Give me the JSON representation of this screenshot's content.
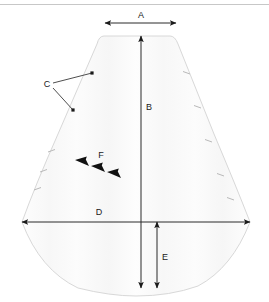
{
  "diagram": {
    "background_color": "#ffffff",
    "shape_fill_color": "#fbfbfb",
    "shape_stroke_color": "#d8d8d8",
    "dimension_line_color": "#2b2b2b",
    "label_color": "#1a1a1a",
    "header_rule_color": "#c7c7c7",
    "labels": {
      "a": "A",
      "b": "B",
      "c": "C",
      "d": "D",
      "e": "E",
      "f": "F"
    },
    "dimensions": [
      {
        "key": "a",
        "label": "A",
        "orientation": "horizontal",
        "arrow_heads": "both",
        "x1": 105,
        "x2": 176,
        "y": 23,
        "label_x": 141,
        "label_y": 16,
        "description": "top width"
      },
      {
        "key": "b",
        "label": "B",
        "orientation": "vertical",
        "arrow_heads": "both",
        "x": 141,
        "y1": 36,
        "y2": 288,
        "label_x": 149,
        "label_y": 108,
        "description": "overall height from top edge to bottom curve"
      },
      {
        "key": "d",
        "label": "D",
        "orientation": "horizontal",
        "arrow_heads": "both",
        "x1": 22,
        "x2": 250,
        "y": 222,
        "label_x": 99,
        "label_y": 213,
        "description": "widest horizontal span"
      },
      {
        "key": "e",
        "label": "E",
        "orientation": "vertical",
        "arrow_heads": "both",
        "x": 157,
        "y1": 222,
        "y2": 288,
        "label_x": 165,
        "label_y": 258,
        "description": "depth of bottom curve below widest span"
      }
    ],
    "callouts": [
      {
        "key": "c",
        "label": "C",
        "label_x": 47,
        "label_y": 85,
        "leaders": [
          {
            "x1": 53,
            "y1": 83,
            "x2": 92,
            "y2": 73
          },
          {
            "x1": 53,
            "y1": 88,
            "x2": 73,
            "y2": 110
          }
        ],
        "description": "corner radius callout with two leader lines"
      },
      {
        "key": "f",
        "label": "F",
        "label_x": 101,
        "label_y": 156,
        "chevrons": [
          {
            "x": 75,
            "y": 160
          },
          {
            "x": 91,
            "y": 166
          },
          {
            "x": 107,
            "y": 172
          }
        ],
        "description": "grain direction arrows pointing down-right"
      }
    ],
    "edge_ticks": {
      "left": [
        {
          "x": 48,
          "y": 152
        },
        {
          "x": 40,
          "y": 172
        },
        {
          "x": 34,
          "y": 190
        }
      ],
      "right": [
        {
          "x": 190,
          "y": 74
        },
        {
          "x": 201,
          "y": 108
        },
        {
          "x": 212,
          "y": 142
        },
        {
          "x": 224,
          "y": 176
        },
        {
          "x": 234,
          "y": 200
        }
      ]
    },
    "outline_path": "M 104 36 Q 99 36 97 44 L 58 134 Q 35 186 22 222 Q 40 270 78 288 Q 110 296 136 296 Q 170 296 198 286 Q 232 268 250 222 Q 236 186 214 134 L 178 44 Q 175 36 170 36 Z"
  }
}
